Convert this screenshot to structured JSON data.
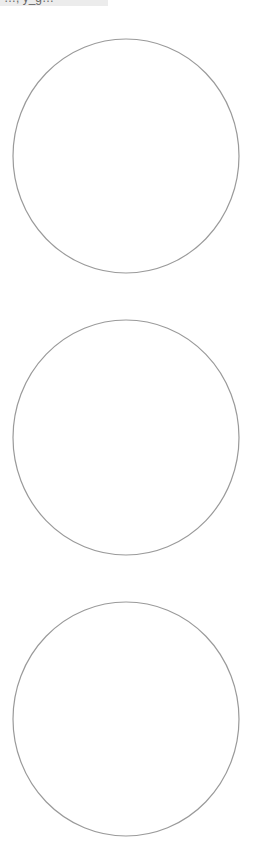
{
  "top_label": {
    "text": "…, y_g…",
    "clipped": true
  },
  "shapes": [
    {
      "kind": "circle-outline",
      "label": "circle-1"
    },
    {
      "kind": "circle-outline",
      "label": "circle-2"
    },
    {
      "kind": "circle-outline",
      "label": "circle-3"
    }
  ],
  "colors": {
    "stroke": "#9a9a9a",
    "label_background": "#ececec",
    "background": "#ffffff"
  }
}
